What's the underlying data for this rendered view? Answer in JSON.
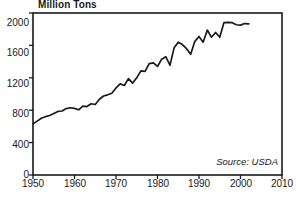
{
  "chart_data": {
    "type": "line",
    "title": "Million Tons",
    "xlabel": "",
    "ylabel": "Million Tons",
    "xlim": [
      1950,
      2010
    ],
    "ylim": [
      0,
      2000
    ],
    "xticks": [
      1950,
      1960,
      1970,
      1980,
      1990,
      2000,
      2010
    ],
    "yticks": [
      0,
      400,
      800,
      1200,
      1600,
      2000
    ],
    "grid": false,
    "legend": null,
    "annotations": [
      {
        "text": "Source: USDA",
        "position": "bottom-right",
        "style": "italic"
      }
    ],
    "line_color": "#1a1a1a",
    "series": [
      {
        "name": "Grain Production",
        "x": [
          1950,
          1951,
          1952,
          1953,
          1954,
          1955,
          1956,
          1957,
          1958,
          1959,
          1960,
          1961,
          1962,
          1963,
          1964,
          1965,
          1966,
          1967,
          1968,
          1969,
          1970,
          1971,
          1972,
          1973,
          1974,
          1975,
          1976,
          1977,
          1978,
          1979,
          1980,
          1981,
          1982,
          1983,
          1984,
          1985,
          1986,
          1987,
          1988,
          1989,
          1990,
          1991,
          1992,
          1993,
          1994,
          1995,
          1996,
          1997,
          1998,
          1999,
          2000,
          2001,
          2002
        ],
        "values": [
          631,
          665,
          700,
          720,
          735,
          760,
          785,
          790,
          820,
          830,
          822,
          805,
          850,
          845,
          880,
          870,
          935,
          975,
          990,
          1010,
          1075,
          1125,
          1105,
          1190,
          1135,
          1200,
          1285,
          1280,
          1375,
          1385,
          1340,
          1430,
          1460,
          1355,
          1570,
          1640,
          1610,
          1560,
          1490,
          1650,
          1710,
          1640,
          1790,
          1700,
          1760,
          1700,
          1880,
          1885,
          1880,
          1855,
          1850,
          1870,
          1865
        ]
      }
    ]
  },
  "axis": {
    "y_labels": [
      "2000",
      "1600",
      "1200",
      "800",
      "400",
      "0"
    ],
    "x_labels": [
      "1950",
      "1960",
      "1970",
      "1980",
      "1990",
      "2000",
      "2010"
    ]
  },
  "source_note": "Source: USDA"
}
